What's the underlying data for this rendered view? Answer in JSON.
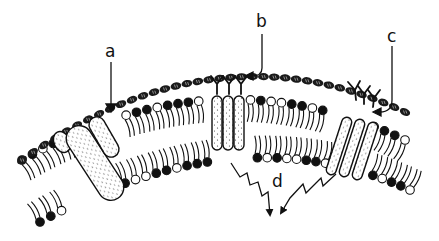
{
  "diagram": {
    "labels": [
      {
        "id": "a",
        "text": "a",
        "x": 111,
        "y": 56,
        "points_to": "integral membrane protein under glycocalyx"
      },
      {
        "id": "b",
        "text": "b",
        "x": 257,
        "y": 27,
        "points_to": "receptor (YYY) on central transmembrane protein"
      },
      {
        "id": "c",
        "text": "c",
        "x": 387,
        "y": 41,
        "points_to": "receptor (YYY) on right transmembrane protein"
      },
      {
        "id": "d",
        "text": "d",
        "x": 273,
        "y": 187,
        "points_to": "intracellular signaling arrows"
      }
    ],
    "components": {
      "glycocalyx": "chain of dark oval glycoprotein beads above outer leaflet",
      "lipid_bilayer": "phospholipids with black and white heads and wavy tails",
      "proteins": [
        "left small oval protein",
        "left long transmembrane protein",
        "left medium transmembrane protein",
        "central three-rod receptor",
        "right three-rod receptor"
      ],
      "receptors": [
        "YYY central",
        "YYY right"
      ],
      "signals": [
        "zigzag arrow left",
        "zigzag arrow right"
      ]
    },
    "colors": {
      "ink": "#111111",
      "paper": "#ffffff"
    }
  }
}
